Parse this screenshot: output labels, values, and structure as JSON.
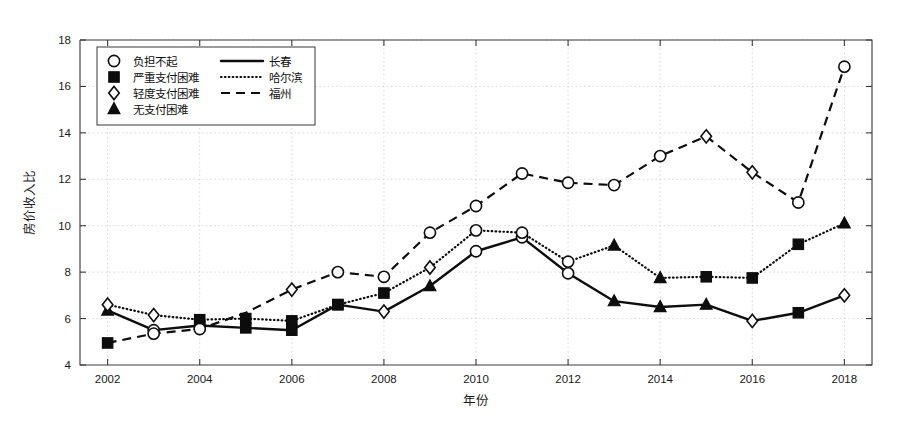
{
  "chart_data": {
    "type": "line",
    "title": "",
    "xlabel": "年份",
    "ylabel": "房价收入比",
    "xlim": [
      2001.4,
      2018.6
    ],
    "ylim": [
      4,
      18
    ],
    "grid": true,
    "legend_position": "upper-left",
    "x": [
      2002,
      2003,
      2004,
      2005,
      2006,
      2007,
      2008,
      2009,
      2010,
      2011,
      2012,
      2013,
      2014,
      2015,
      2016,
      2017,
      2018
    ],
    "xticks": [
      "2002",
      "2004",
      "2006",
      "2008",
      "2010",
      "2012",
      "2014",
      "2016",
      "2018"
    ],
    "xtick_values": [
      2002,
      2004,
      2006,
      2008,
      2010,
      2012,
      2014,
      2016,
      2018
    ],
    "yticks": [
      "4",
      "6",
      "8",
      "10",
      "12",
      "14",
      "16",
      "18"
    ],
    "ytick_values": [
      4,
      6,
      8,
      10,
      12,
      14,
      16,
      18
    ],
    "series": [
      {
        "name": "长春",
        "line_style": "solid",
        "values": [
          6.35,
          5.5,
          5.7,
          5.6,
          5.5,
          6.6,
          6.3,
          7.4,
          8.9,
          9.5,
          7.95,
          6.75,
          6.5,
          6.6,
          5.9,
          6.25,
          7.0
        ],
        "markers": [
          "triangle",
          "circle",
          "square",
          "square",
          "square",
          "square",
          "diamond",
          "triangle",
          "circle",
          "circle",
          "circle",
          "triangle",
          "triangle",
          "triangle",
          "diamond",
          "square",
          "diamond"
        ]
      },
      {
        "name": "哈尔滨",
        "line_style": "dotted",
        "values": [
          6.6,
          6.15,
          5.95,
          6.0,
          5.9,
          6.6,
          7.1,
          8.2,
          9.8,
          9.7,
          8.45,
          9.15,
          7.75,
          7.8,
          7.75,
          9.2,
          10.1
        ],
        "markers": [
          "diamond",
          "diamond",
          "square",
          "square",
          "square",
          "square",
          "square",
          "diamond",
          "circle",
          "circle",
          "circle",
          "triangle",
          "triangle",
          "square",
          "square",
          "square",
          "triangle"
        ]
      },
      {
        "name": "福州",
        "line_style": "dashed",
        "values": [
          4.95,
          5.35,
          5.55,
          6.25,
          7.25,
          8.0,
          7.8,
          9.7,
          10.85,
          12.25,
          11.85,
          11.75,
          13.0,
          13.85,
          12.3,
          11.0,
          16.85
        ],
        "markers": [
          "square",
          "circle",
          "circle",
          "none",
          "diamond",
          "circle",
          "circle",
          "circle",
          "circle",
          "circle",
          "circle",
          "circle",
          "circle",
          "diamond",
          "diamond",
          "circle",
          "circle"
        ]
      }
    ],
    "marker_legend": [
      {
        "marker": "circle",
        "label": "负担不起"
      },
      {
        "marker": "square",
        "label": "严重支付困难"
      },
      {
        "marker": "diamond",
        "label": "轻度支付困难"
      },
      {
        "marker": "triangle",
        "label": "无支付困难"
      }
    ],
    "line_legend": [
      {
        "line_style": "solid",
        "label": "长春"
      },
      {
        "line_style": "dotted",
        "label": "哈尔滨"
      },
      {
        "line_style": "dashed",
        "label": "福州"
      }
    ]
  }
}
